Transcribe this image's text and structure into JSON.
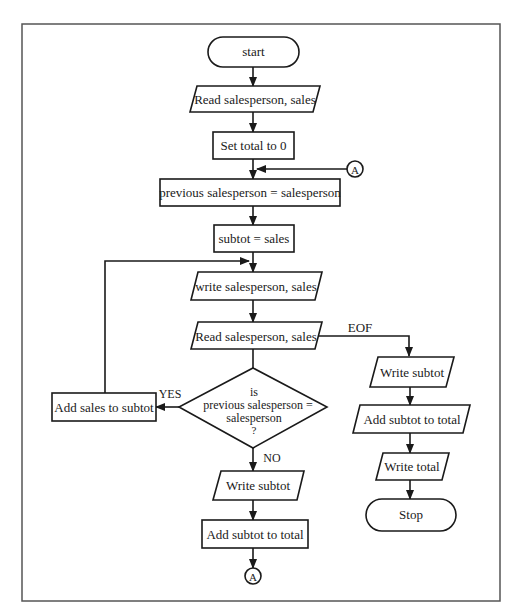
{
  "flowchart": {
    "nodes": {
      "start": "start",
      "read1": "Read salesperson, sales",
      "set_total": "Set total to 0",
      "prev_assign": "previous salesperson = salesperson",
      "subtot_assign": "subtot = sales",
      "write_sp": "write salesperson, sales",
      "read2": "Read salesperson, sales",
      "decision_l1": "is",
      "decision_l2": "previous salesperson =",
      "decision_l3": "salesperson",
      "decision_l4": "?",
      "add_sales": "Add sales to subtot",
      "write_subtot_no": "Write subtot",
      "add_subtot_no": "Add subtot to total",
      "write_subtot_eof": "Write subtot",
      "add_subtot_eof": "Add subtot to total",
      "write_total": "Write total",
      "stop": "Stop"
    },
    "connectors": {
      "top": "A",
      "bottom": "A"
    },
    "edge_labels": {
      "eof": "EOF",
      "yes": "YES",
      "no": "NO"
    }
  }
}
